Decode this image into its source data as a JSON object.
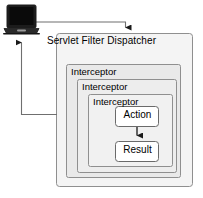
{
  "diagram": {
    "title": "Servlet Filter Dispatcher",
    "client_icon": "laptop-icon",
    "layers": [
      {
        "label": "Interceptor"
      },
      {
        "label": "Interceptor"
      },
      {
        "label": "Interceptor"
      }
    ],
    "nodes": {
      "action": "Action",
      "result": "Result"
    },
    "colors": {
      "background": "#ffffff",
      "stroke": "#8a8a8a",
      "fill_outer": "#f2f2f2",
      "fill_layer1": "#e8e8e8",
      "fill_layer2": "#ececec",
      "fill_layer3": "#f0f0f0",
      "node_fill": "#ffffff",
      "connector": "#6f6f6f",
      "arrow": "#1a1a1a",
      "text": "#000000",
      "laptop_body": "#1c1c1c",
      "laptop_screen": "#0a0a0a",
      "laptop_base": "#3a3a3a"
    }
  }
}
